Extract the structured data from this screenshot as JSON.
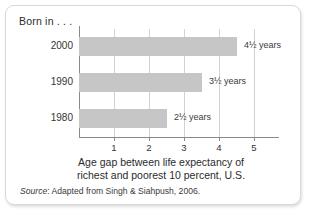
{
  "panel": {
    "born_in_label": "Born in . . .",
    "source_word": "Source",
    "source_rest": ": Adapted from Singh & Siahpush, 2006."
  },
  "chart_data": {
    "type": "bar",
    "orientation": "horizontal",
    "title": "",
    "categories": [
      "2000",
      "1990",
      "1980"
    ],
    "values": [
      4.5,
      3.5,
      2.5
    ],
    "value_labels": [
      "4½ years",
      "3½ years",
      "2½ years"
    ],
    "xlabel": "Age gap between life expectancy of richest and poorest 10 percent, U.S.",
    "xlabel_line1": "Age gap between life expectancy of",
    "xlabel_line2": "richest and poorest 10 percent, U.S.",
    "ylabel": "Born in . . .",
    "xlim": [
      0,
      5.5
    ],
    "xticks": [
      1,
      2,
      3,
      4,
      5
    ],
    "xtick_labels": [
      "1",
      "2",
      "3",
      "4",
      "5"
    ],
    "grid": true,
    "legend": false,
    "bar_color": "#c6c6c6",
    "axis_color": "#8a8a8a",
    "gridline_color": "#d2d2d2"
  }
}
